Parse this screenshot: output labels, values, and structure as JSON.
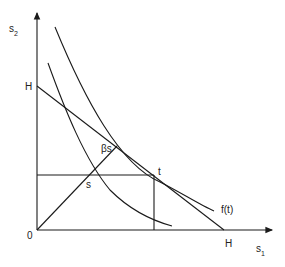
{
  "diagram": {
    "axes": {
      "y_label": "s",
      "y_label_sub": "2",
      "x_label": "s",
      "x_label_sub": "1",
      "origin_label": "0"
    },
    "labels": {
      "h_y_axis": "H",
      "h_x_axis": "H",
      "point_t": "t",
      "point_s": "s",
      "point_beta_s": "βs",
      "curve_label": "f(t)"
    },
    "colors": {
      "line": "#1a1a1a",
      "background": "#ffffff"
    }
  }
}
